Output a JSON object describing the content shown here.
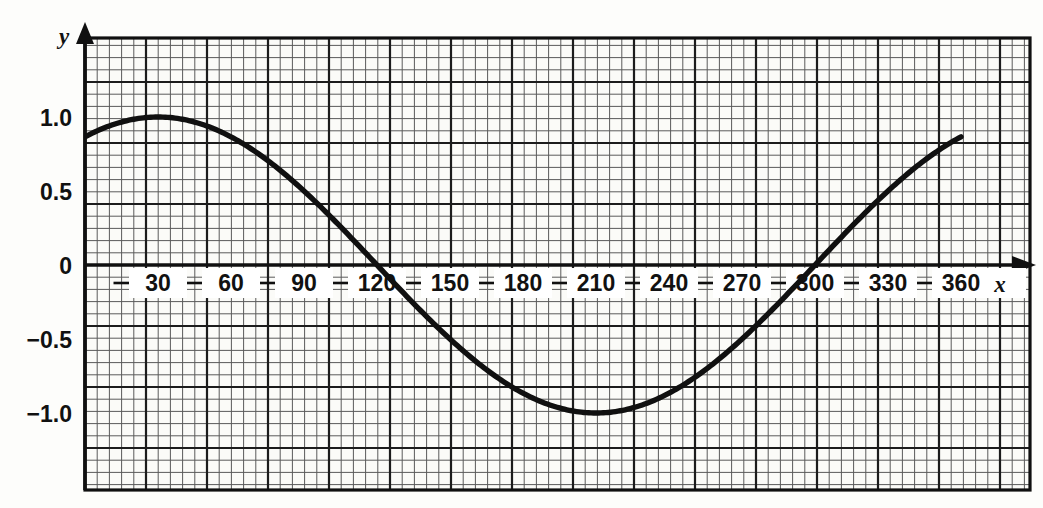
{
  "chart_data": {
    "type": "line",
    "title": "",
    "xlabel": "x",
    "ylabel": "y",
    "xlim": [
      -35,
      388
    ],
    "ylim": [
      -1.53,
      1.53
    ],
    "xticks": [
      30,
      60,
      90,
      120,
      150,
      180,
      210,
      240,
      270,
      300,
      330,
      360
    ],
    "xticklabels": [
      "30",
      "60",
      "90",
      "120",
      "150",
      "180",
      "210",
      "240",
      "270",
      "300",
      "330",
      "360"
    ],
    "yticks": [
      1.0,
      0.5,
      0,
      -0.5,
      -1.0
    ],
    "yticklabels": [
      "1.0",
      "0.5",
      "0",
      "−0.5",
      "−1.0"
    ],
    "grid": "on",
    "grid_minor_step_x": 5,
    "grid_minor_step_y": 0.0833,
    "grid_major_step_x": 25,
    "grid_major_step_y": 0.4167,
    "legend": "none",
    "series": [
      {
        "name": "y = sin(x + 60°)",
        "phase_deg": 60,
        "amplitude": 1.0,
        "x": [
          0,
          10,
          20,
          30,
          40,
          50,
          60,
          70,
          80,
          90,
          100,
          110,
          120,
          130,
          140,
          150,
          160,
          170,
          180,
          190,
          200,
          210,
          220,
          230,
          240,
          250,
          260,
          270,
          280,
          290,
          300,
          310,
          320,
          330,
          340,
          350,
          360
        ],
        "values": [
          0.866,
          0.94,
          0.985,
          1.0,
          0.985,
          0.94,
          0.866,
          0.766,
          0.643,
          0.5,
          0.342,
          0.174,
          0.0,
          -0.174,
          -0.342,
          -0.5,
          -0.643,
          -0.766,
          -0.866,
          -0.94,
          -0.985,
          -1.0,
          -0.985,
          -0.94,
          -0.866,
          -0.766,
          -0.643,
          -0.5,
          -0.342,
          -0.174,
          0.0,
          0.174,
          0.342,
          0.5,
          0.643,
          0.766,
          0.866
        ]
      }
    ],
    "annotations": {
      "maximum": {
        "x": 30,
        "y": 1.0
      },
      "minimum": {
        "x": 210,
        "y": -1.0
      },
      "zero_crossing_descending": {
        "x": 120,
        "y": 0
      },
      "zero_crossing_ascending": {
        "x": 300,
        "y": 0
      },
      "start": {
        "x": 0,
        "y": 0.866
      },
      "end": {
        "x": 360,
        "y": 0.866
      }
    },
    "colors": {
      "curve": "#101010",
      "axis": "#101010",
      "grid_major": "#202020",
      "grid_minor": "#555555",
      "background": "#fdfdfb",
      "plot_background": "#fbfbf8"
    }
  }
}
